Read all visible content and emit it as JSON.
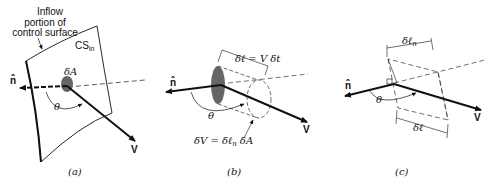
{
  "panels": [
    {
      "id": "a",
      "caption": "(a)",
      "labels": {
        "surface_note": "Inflow portion of control surface",
        "surface_note_line1": "Inflow",
        "surface_note_line2": "portion of",
        "surface_note_line3": "control surface",
        "surface_name": "CS",
        "surface_name_sub": "in",
        "area": "δA",
        "normal": "n̂",
        "angle": "θ",
        "velocity": "V"
      }
    },
    {
      "id": "b",
      "caption": "(b)",
      "labels": {
        "length_eq": "δℓ = V δt",
        "volume_eq_lhs": "δV = δℓ",
        "volume_eq_sub": "n",
        "volume_eq_rhs": " δA",
        "normal": "n̂",
        "angle": "θ",
        "velocity": "V"
      }
    },
    {
      "id": "c",
      "caption": "(c)",
      "labels": {
        "normal_length": "δℓ",
        "normal_length_sub": "n",
        "length": "δℓ",
        "normal": "n̂",
        "angle": "θ",
        "velocity": "V"
      }
    }
  ],
  "colors": {
    "ink": "#111111",
    "area_fill": "#666666"
  }
}
